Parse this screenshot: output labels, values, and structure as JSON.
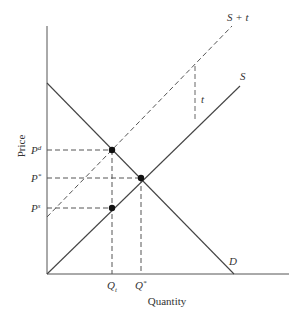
{
  "diagram": {
    "axes": {
      "x_label": "Quantity",
      "y_label": "Price"
    },
    "curves": {
      "demand": {
        "label": "D"
      },
      "supply": {
        "label": "S"
      },
      "supply_tax": {
        "label": "S + t"
      },
      "tax_gap": {
        "label": "t"
      }
    },
    "price_labels": {
      "pd": {
        "base": "P",
        "sup": "d"
      },
      "pstar": {
        "base": "P",
        "sup": "*"
      },
      "ps": {
        "base": "P",
        "sup": "s"
      }
    },
    "quantity_labels": {
      "qt": {
        "base": "Q",
        "sub": "t"
      },
      "qstar": {
        "base": "Q",
        "sup": "*"
      }
    },
    "colors": {
      "line": "#444444",
      "dash": "#555555",
      "point": "#111111",
      "background": "#ffffff"
    }
  }
}
